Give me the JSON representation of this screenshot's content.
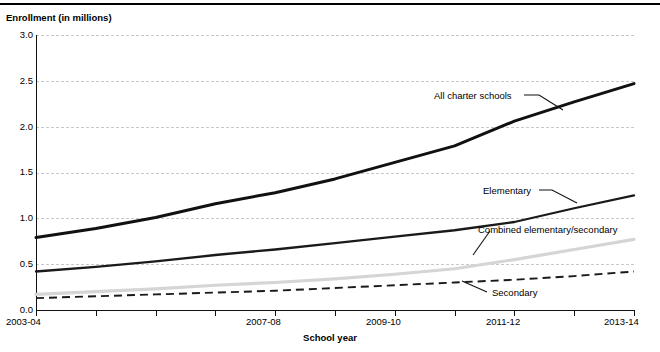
{
  "figure": {
    "clipped_header_text": "",
    "y_axis_title": "Enrollment (in millions)",
    "x_axis_title": "School year"
  },
  "chart_data": {
    "type": "line",
    "title": "",
    "xlabel": "School year",
    "ylabel": "Enrollment (in millions)",
    "ylim": [
      0.0,
      3.0
    ],
    "ytick_labels": [
      "3.0",
      "2.5",
      "2.0",
      "1.5",
      "1.0",
      "0.5",
      "0.0"
    ],
    "ytick_values": [
      3.0,
      2.5,
      2.0,
      1.5,
      1.0,
      0.5,
      0.0
    ],
    "grid": true,
    "grid_axis": "y",
    "legend": "inline-annotations",
    "categories": [
      "2003-04",
      "2004-05",
      "2005-06",
      "2006-07",
      "2007-08",
      "2008-09",
      "2009-10",
      "2010-11",
      "2011-12",
      "2012-13",
      "2013-14"
    ],
    "xtick_labels_shown": [
      "2003-04",
      "",
      "",
      "",
      "2007-08",
      "",
      "2009-10",
      "",
      "2011-12",
      "",
      "2013-14"
    ],
    "series": [
      {
        "name": "All charter schools",
        "style": "solid-thick-black",
        "color": "#111111",
        "values": [
          0.79,
          0.89,
          1.01,
          1.16,
          1.28,
          1.43,
          1.61,
          1.79,
          2.06,
          2.27,
          2.47
        ]
      },
      {
        "name": "Elementary",
        "style": "solid-black",
        "color": "#1a1a1a",
        "values": [
          0.42,
          0.47,
          0.53,
          0.6,
          0.66,
          0.73,
          0.8,
          0.87,
          0.96,
          1.11,
          1.25
        ]
      },
      {
        "name": "Combined elementary/secondary",
        "style": "solid-lightgray",
        "color": "#d5d5d5",
        "values": [
          0.17,
          0.2,
          0.23,
          0.27,
          0.3,
          0.34,
          0.39,
          0.45,
          0.55,
          0.66,
          0.77
        ]
      },
      {
        "name": "Secondary",
        "style": "dashed-black",
        "color": "#1a1a1a",
        "values": [
          0.13,
          0.15,
          0.17,
          0.19,
          0.21,
          0.24,
          0.27,
          0.3,
          0.33,
          0.37,
          0.42
        ]
      }
    ],
    "annotations": [
      {
        "text": "All charter schools",
        "x": 0.0,
        "y": 0.0
      },
      {
        "text": "Elementary",
        "x": 0.0,
        "y": 0.0
      },
      {
        "text": "Combined elementary/secondary",
        "x": 0.0,
        "y": 0.0
      },
      {
        "text": "Secondary",
        "x": 0.0,
        "y": 0.0
      }
    ]
  }
}
